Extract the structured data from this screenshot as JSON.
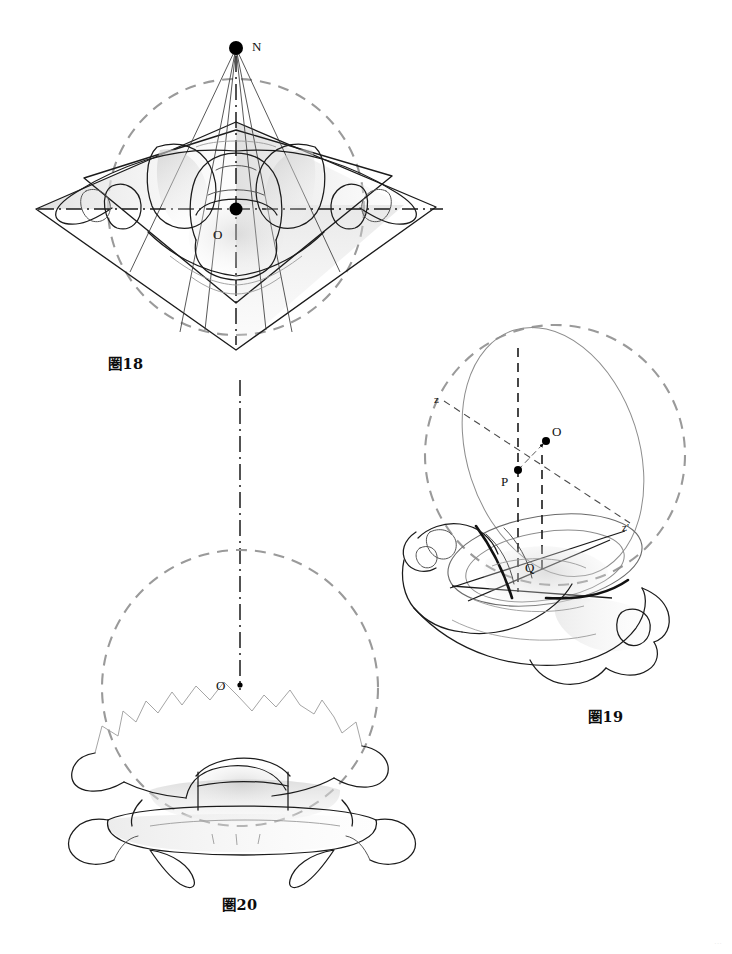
{
  "page": {
    "background_color": "#ffffff",
    "width": 732,
    "height": 954,
    "corner_mark": "···"
  },
  "colors": {
    "ink": "#1b1b1b",
    "sphere_dash": "#9a9a9a",
    "soft_line": "#8d8d8d",
    "shade_fill": "#d9d9d9",
    "heavy": "#111111"
  },
  "figures": [
    {
      "id": "fig18",
      "caption": "圏18",
      "view": "superior (axial) view of vertebra inscribed in reference sphere",
      "labels": [
        {
          "name": "point-n",
          "text": "N",
          "x": 252,
          "y": 51,
          "dot": true,
          "dot_r": 7
        },
        {
          "name": "point-o",
          "text": "O",
          "x": 219,
          "y": 235,
          "dot": true,
          "dot_r": 6.5
        }
      ],
      "sphere": {
        "cx": 236,
        "cy": 207,
        "r": 128
      },
      "apex": {
        "x": 236,
        "y": 48
      }
    },
    {
      "id": "fig19",
      "caption": "圏19",
      "view": "oblique three-quarter view with great circle and polar axis",
      "labels": [
        {
          "name": "point-z",
          "text": "z",
          "x": 436,
          "y": 400,
          "dot": false
        },
        {
          "name": "point-z-prime",
          "text": "z'",
          "x": 625,
          "y": 529,
          "dot": false
        },
        {
          "name": "point-o",
          "text": "O",
          "x": 549,
          "y": 434,
          "dot": true,
          "dot_r": 4
        },
        {
          "name": "point-p",
          "text": "P",
          "x": 500,
          "y": 470,
          "dot": true,
          "dot_r": 4
        },
        {
          "name": "point-q",
          "text": "Q",
          "x": 531,
          "y": 568,
          "dot": false
        }
      ],
      "sphere": {
        "cx": 555,
        "cy": 455,
        "r": 130
      }
    },
    {
      "id": "fig20",
      "caption": "圏20",
      "view": "posterior (coronal) view of vertebra with reference sphere",
      "labels": [
        {
          "name": "point-o",
          "text": "O",
          "x": 219,
          "y": 688,
          "dot": true,
          "dot_r": 2.6
        }
      ],
      "sphere": {
        "cx": 240,
        "cy": 688,
        "r": 138
      }
    }
  ],
  "connectors": [
    {
      "name": "vertical-axis-connector",
      "from_figure": "fig18",
      "to_figure": "fig20",
      "style": "dash-dot"
    }
  ]
}
